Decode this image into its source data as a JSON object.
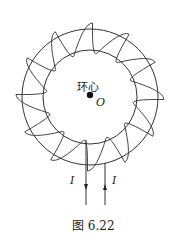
{
  "figure": {
    "caption": "图 6.22",
    "center_label": "环心",
    "center_point_label": "O",
    "current_label_left": "I",
    "current_label_right": "I",
    "colors": {
      "line": "#333333",
      "background": "#ffffff"
    },
    "toroid": {
      "center": [
        90,
        97
      ],
      "outer_radius": 68,
      "inner_radius": 47,
      "turns": 12
    },
    "leads": {
      "left_direction": "down",
      "right_direction": "up"
    }
  }
}
